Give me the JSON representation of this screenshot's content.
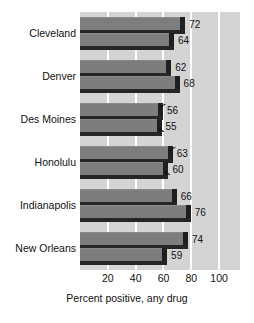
{
  "chart_data": {
    "type": "bar",
    "orientation": "horizontal",
    "title": "",
    "xlabel": "Percent positive, any drug",
    "ylabel": "",
    "xlim": [
      0,
      115
    ],
    "xticks": [
      20,
      40,
      60,
      80,
      100
    ],
    "xtick_labels": [
      "20",
      "40",
      "60",
      "80",
      "100"
    ],
    "gridlines": [
      20,
      40,
      60,
      80,
      100
    ],
    "grid": true,
    "legend": "none",
    "categories": [
      "Cleveland",
      "Denver",
      "Des Moines",
      "Honolulu",
      "Indianapolis",
      "New Orleans"
    ],
    "series": [
      {
        "name": "upper",
        "values": [
          72,
          62,
          56,
          63,
          66,
          74
        ]
      },
      {
        "name": "lower",
        "values": [
          64,
          68,
          55,
          60,
          76,
          59
        ]
      }
    ],
    "data_labels": [
      {
        "category": "Cleveland",
        "upper": "72",
        "lower": "64"
      },
      {
        "category": "Denver",
        "upper": "62",
        "lower": "68"
      },
      {
        "category": "Des Moines",
        "upper": "56",
        "lower": "55"
      },
      {
        "category": "Honolulu",
        "upper": "63",
        "lower": "60"
      },
      {
        "category": "Indianapolis",
        "upper": "66",
        "lower": "76"
      },
      {
        "category": "New Orleans",
        "upper": "74",
        "lower": "59"
      }
    ],
    "colors": {
      "bar_face": "#7d7d7d",
      "bar_shadow": "#262626",
      "plot_background": "#d4d4d4",
      "gridline": "#ffffff",
      "text": "#111111",
      "page_background": "#ffffff"
    }
  }
}
